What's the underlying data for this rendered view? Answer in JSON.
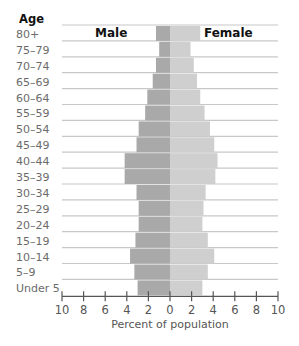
{
  "chart_data": {
    "type": "bar",
    "orientation": "horizontal-pyramid",
    "title": "",
    "age_header": "Age",
    "xlabel": "Percent of population",
    "ylabel": "Age",
    "xlim": [
      -10,
      10
    ],
    "xticks": [
      -10,
      -8,
      -6,
      -4,
      -2,
      0,
      2,
      4,
      6,
      8,
      10
    ],
    "xtick_labels": [
      "10",
      "8",
      "6",
      "4",
      "2",
      "0",
      "2",
      "4",
      "6",
      "8",
      "10"
    ],
    "grid": true,
    "categories": [
      "80+",
      "75–79",
      "70–74",
      "65–69",
      "60–64",
      "55–59",
      "50–54",
      "45–49",
      "40–44",
      "35–39",
      "30–34",
      "25–29",
      "20–24",
      "15–19",
      "10–14",
      "5–9",
      "Under 5"
    ],
    "series": [
      {
        "name": "Male",
        "side": "left",
        "color": "#a9a9a9",
        "values": [
          1.3,
          1.0,
          1.3,
          1.6,
          2.1,
          2.3,
          2.9,
          3.1,
          4.2,
          4.2,
          3.1,
          2.9,
          2.9,
          3.2,
          3.7,
          3.3,
          3.0
        ]
      },
      {
        "name": "Female",
        "side": "right",
        "color": "#cfcfcf",
        "values": [
          2.8,
          1.9,
          2.2,
          2.5,
          2.8,
          3.2,
          3.7,
          4.1,
          4.4,
          4.2,
          3.3,
          3.1,
          3.0,
          3.5,
          4.1,
          3.5,
          3.0
        ]
      }
    ],
    "legend": "inline-top"
  }
}
